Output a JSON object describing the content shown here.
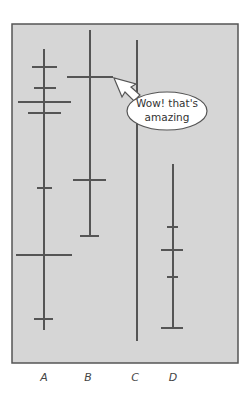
{
  "diagram": {
    "type": "vertical-line-with-ticks",
    "background": "#d6d6d6",
    "line_color": "#555555",
    "columns": [
      {
        "label": "A",
        "x": 44,
        "top": 49,
        "bottom": 330,
        "ticks": [
          {
            "y": 67,
            "x1": 32,
            "x2": 57
          },
          {
            "y": 88,
            "x1": 34,
            "x2": 56
          },
          {
            "y": 102,
            "x1": 18,
            "x2": 71
          },
          {
            "y": 113,
            "x1": 28,
            "x2": 61
          },
          {
            "y": 188,
            "x1": 37,
            "x2": 52
          },
          {
            "y": 255,
            "x1": 16,
            "x2": 72
          },
          {
            "y": 319,
            "x1": 34,
            "x2": 53
          }
        ]
      },
      {
        "label": "B",
        "x": 90,
        "top": 30,
        "bottom": 236,
        "ticks": [
          {
            "y": 77,
            "x1": 67,
            "x2": 113
          },
          {
            "y": 180,
            "x1": 73,
            "x2": 106
          },
          {
            "y": 236,
            "x1": 80,
            "x2": 99
          }
        ]
      },
      {
        "label": "C",
        "x": 137,
        "top": 40,
        "bottom": 341,
        "ticks": []
      },
      {
        "label": "D",
        "x": 173,
        "top": 164,
        "bottom": 328,
        "ticks": [
          {
            "y": 227,
            "x1": 167,
            "x2": 178
          },
          {
            "y": 250,
            "x1": 161,
            "x2": 183
          },
          {
            "y": 277,
            "x1": 167,
            "x2": 178
          },
          {
            "y": 328,
            "x1": 161,
            "x2": 183
          }
        ]
      }
    ],
    "callout": {
      "line1": "Wow! that's",
      "line2": "amazing",
      "points_to": "B-highlighted-tick"
    }
  }
}
